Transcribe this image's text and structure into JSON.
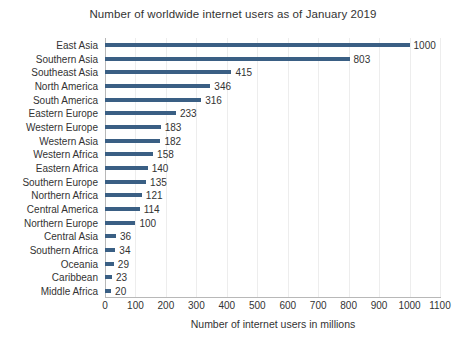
{
  "chart_data": {
    "type": "bar",
    "orientation": "horizontal",
    "title": "Number of worldwide internet users as of January 2019",
    "xlabel": "Number of internet users in millions",
    "ylabel": "",
    "xlim": [
      0,
      1100
    ],
    "xticks": [
      0,
      100,
      200,
      300,
      400,
      500,
      600,
      700,
      800,
      900,
      1000,
      1100
    ],
    "xtick_labels": [
      "0",
      "100",
      "200",
      "300",
      "400",
      "500",
      "600",
      "700",
      "800",
      "900",
      "1000",
      "1100"
    ],
    "grid": "vertical",
    "legend": "none",
    "bar_color": "#3A5F84",
    "gridline_color": "#EDEDED",
    "axis_color": "#B8B8B8",
    "data_labels": true,
    "categories": [
      "East Asia",
      "Southern Asia",
      "Southeast Asia",
      "North America",
      "South America",
      "Eastern Europe",
      "Western Europe",
      "Western Asia",
      "Western Africa",
      "Eastern Africa",
      "Southern Europe",
      "Northern Africa",
      "Central America",
      "Northern Europe",
      "Central Asia",
      "Southern Africa",
      "Oceania",
      "Caribbean",
      "Middle Africa"
    ],
    "values": [
      1000,
      803,
      415,
      346,
      316,
      233,
      183,
      182,
      158,
      140,
      135,
      121,
      114,
      100,
      36,
      34,
      29,
      23,
      20
    ],
    "value_labels": [
      "1000",
      "803",
      "415",
      "346",
      "316",
      "233",
      "183",
      "182",
      "158",
      "140",
      "135",
      "121",
      "114",
      "100",
      "36",
      "34",
      "29",
      "23",
      "20"
    ]
  }
}
